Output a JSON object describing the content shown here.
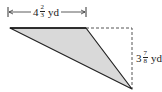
{
  "figure": {
    "type": "right-triangle-area-diagram",
    "shape": "triangle",
    "fill_color": "#d9d9d9",
    "stroke_color": "#222222",
    "base": {
      "whole": "4",
      "numerator": "2",
      "denominator": "3",
      "unit": "yd",
      "label": "4 2/3 yd"
    },
    "height": {
      "whole": "3",
      "numerator": "7",
      "denominator": "8",
      "unit": "yd",
      "label": "3 7/8 yd"
    }
  }
}
